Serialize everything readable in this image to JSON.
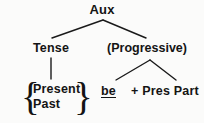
{
  "diagram": {
    "type": "syntax-tree",
    "background_color": "#fbfbfa",
    "line_color": "#1a1a1a",
    "text_color": "#141414",
    "root": {
      "label": "Aux"
    },
    "nodes": {
      "tense": "Tense",
      "progressive": "(Progressive)",
      "be": "be",
      "pres_part": "+ Pres Part"
    },
    "tense_options": {
      "open_brace": "{",
      "close_brace": "}",
      "items": [
        "Present",
        "Past"
      ]
    }
  }
}
